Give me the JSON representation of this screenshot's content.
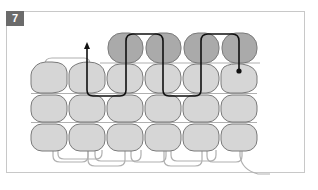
{
  "figure": {
    "step_number": "7",
    "colors": {
      "light_bead": "#d6d6d6",
      "dark_bead": "#aaaaaa",
      "bead_outline": "#7a7a7a",
      "thread_active": "#111111",
      "thread_passive": "#b0b0b0",
      "frame_border": "#c8c8c8",
      "badge_bg": "#6b6b6b"
    },
    "rows": [
      {
        "name": "new-row",
        "shade": "dark",
        "columns": [
          3,
          4,
          5,
          6
        ]
      },
      {
        "name": "row-2",
        "shade": "light",
        "columns": [
          1,
          2,
          3,
          4,
          5,
          6
        ]
      },
      {
        "name": "row-3",
        "shade": "light",
        "columns": [
          1,
          2,
          3,
          4,
          5,
          6
        ]
      },
      {
        "name": "row-4",
        "shade": "light",
        "columns": [
          1,
          2,
          3,
          4,
          5,
          6
        ]
      }
    ],
    "thread_path": {
      "start": "arrow pointing up at column 2",
      "end": "dot at column 6 of row 2"
    }
  }
}
